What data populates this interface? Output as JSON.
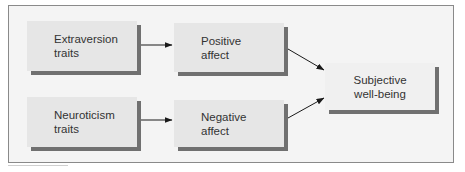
{
  "diagram": {
    "nodes": [
      {
        "id": "extraversion",
        "lines": [
          "Extraversion",
          "traits"
        ]
      },
      {
        "id": "positive_affect",
        "lines": [
          "Positive",
          "affect"
        ]
      },
      {
        "id": "neuroticism",
        "lines": [
          "Neuroticism",
          "traits"
        ]
      },
      {
        "id": "negative_affect",
        "lines": [
          "Negative",
          "affect"
        ]
      },
      {
        "id": "swb",
        "lines": [
          "Subjective",
          "well-being"
        ]
      }
    ],
    "edges": [
      {
        "from": "extraversion",
        "to": "positive_affect"
      },
      {
        "from": "neuroticism",
        "to": "negative_affect"
      },
      {
        "from": "positive_affect",
        "to": "swb"
      },
      {
        "from": "negative_affect",
        "to": "swb"
      }
    ]
  },
  "colors": {
    "frame_bg": "#f4f4f4",
    "node_fill": "#e6e6e6",
    "node_shadow": "#707070",
    "arrow": "#1a1a1a",
    "text": "#333333"
  }
}
